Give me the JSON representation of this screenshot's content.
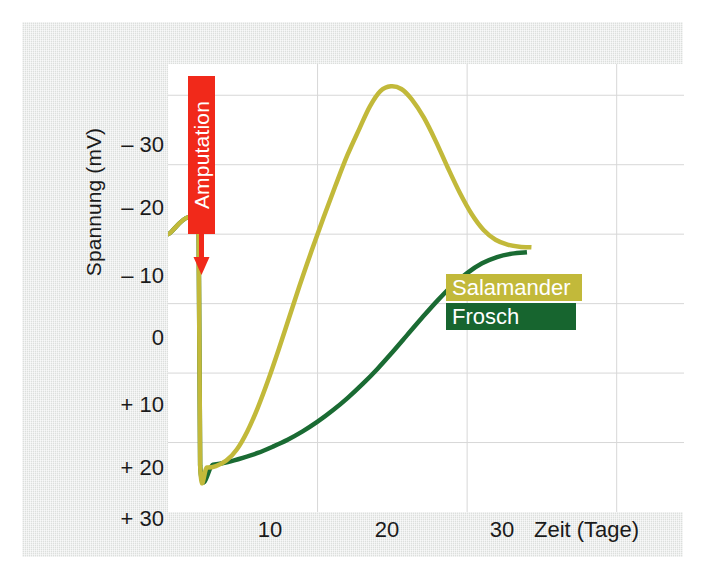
{
  "chart_data": {
    "type": "line",
    "title": "",
    "xlabel": "Zeit (Tage)",
    "ylabel": "Spannung (mV)",
    "xlim": [
      0,
      34.5
    ],
    "ylim": [
      -34.5,
      30
    ],
    "y_inverted": true,
    "grid": true,
    "xticks": [
      10,
      20,
      30
    ],
    "xticklabels": [
      "10",
      "20",
      "30"
    ],
    "yticks": [
      -30,
      -20,
      -10,
      0,
      10,
      20,
      30
    ],
    "yticklabels": [
      "– 30",
      "– 20",
      "– 10",
      "0",
      "+ 10",
      "+ 20",
      "+ 30"
    ],
    "legend_position": "inside-right",
    "annotations": [
      {
        "text": "Amputation",
        "type": "arrow-label",
        "x": 2.1,
        "y_target": -10,
        "color": "#f1291a",
        "text_color": "#ffffff",
        "orientation": "vertical"
      }
    ],
    "series": [
      {
        "name": "Salamander",
        "color": "#c2b93a",
        "legend_bg": "#c2b93a",
        "linewidth": 4.5,
        "points": [
          [
            0.0,
            -10.0
          ],
          [
            2.05,
            -10.0
          ],
          [
            2.15,
            23.3
          ],
          [
            2.6,
            23.6
          ],
          [
            3.2,
            23.4
          ],
          [
            3.9,
            22.6
          ],
          [
            4.6,
            21.0
          ],
          [
            5.3,
            18.4
          ],
          [
            6.0,
            15.0
          ],
          [
            6.7,
            11.0
          ],
          [
            7.4,
            6.6
          ],
          [
            8.1,
            2.0
          ],
          [
            8.8,
            -2.6
          ],
          [
            9.6,
            -7.6
          ],
          [
            10.4,
            -12.4
          ],
          [
            11.2,
            -17.0
          ],
          [
            12.0,
            -21.4
          ],
          [
            12.8,
            -25.2
          ],
          [
            13.5,
            -28.4
          ],
          [
            14.2,
            -30.6
          ],
          [
            14.9,
            -31.3
          ],
          [
            15.6,
            -30.9
          ],
          [
            16.3,
            -29.4
          ],
          [
            17.1,
            -26.8
          ],
          [
            17.9,
            -23.4
          ],
          [
            18.7,
            -19.6
          ],
          [
            19.5,
            -16.0
          ],
          [
            20.3,
            -12.9
          ],
          [
            21.1,
            -10.6
          ],
          [
            21.9,
            -9.2
          ],
          [
            22.7,
            -8.5
          ],
          [
            23.5,
            -8.2
          ],
          [
            24.3,
            -8.1
          ]
        ]
      },
      {
        "name": "Frosch",
        "color": "#1a6b33",
        "legend_bg": "#17652f",
        "linewidth": 4.5,
        "points": [
          [
            0.0,
            -10.0
          ],
          [
            2.05,
            -10.0
          ],
          [
            2.15,
            23.3
          ],
          [
            3.0,
            23.2
          ],
          [
            4.0,
            22.8
          ],
          [
            5.0,
            22.2
          ],
          [
            6.0,
            21.5
          ],
          [
            7.0,
            20.6
          ],
          [
            8.0,
            19.6
          ],
          [
            9.0,
            18.4
          ],
          [
            10.0,
            17.0
          ],
          [
            11.0,
            15.4
          ],
          [
            12.0,
            13.6
          ],
          [
            13.0,
            11.6
          ],
          [
            14.0,
            9.4
          ],
          [
            15.0,
            7.0
          ],
          [
            16.0,
            4.5
          ],
          [
            17.0,
            2.0
          ],
          [
            18.0,
            -0.4
          ],
          [
            19.0,
            -2.6
          ],
          [
            20.0,
            -4.4
          ],
          [
            21.0,
            -5.8
          ],
          [
            22.0,
            -6.7
          ],
          [
            23.0,
            -7.2
          ],
          [
            24.0,
            -7.4
          ]
        ]
      }
    ],
    "notes": {
      "baseline_mV": -10,
      "post_amputation_mV": 23.3,
      "salamander_peak": {
        "x_days": 14.9,
        "y_mV": -31.3
      },
      "frosch_plateau_mV": -7.4
    }
  },
  "figure": {
    "background": "#e3e6e4",
    "plot_background": "#ffffff",
    "grid_color": "#d7d7d7",
    "text_color": "#1b1b1b"
  }
}
